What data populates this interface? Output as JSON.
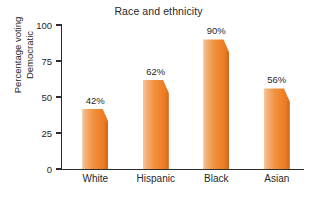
{
  "chart_data": {
    "type": "bar",
    "title": "Race and ethnicity",
    "xlabel": "",
    "ylabel": "Percentage voting Democratic",
    "ylabel_lines": [
      "Percentage voting",
      "Democratic"
    ],
    "categories": [
      "White",
      "Hispanic",
      "Black",
      "Asian"
    ],
    "values": [
      42,
      62,
      90,
      56
    ],
    "value_labels": [
      "42%",
      "62%",
      "90%",
      "56%"
    ],
    "ylim": [
      0,
      100
    ],
    "yticks": [
      0,
      25,
      50,
      75,
      100
    ],
    "ytick_labels": [
      "0",
      "25",
      "50",
      "75",
      "100"
    ],
    "grid": false,
    "legend": "none",
    "bar_color": "#ef8128",
    "bar_color_light": "#f6c79a",
    "bar_color_dark": "#d9701f",
    "axis_color": "#2c2c2c",
    "background": "#ffffff"
  }
}
